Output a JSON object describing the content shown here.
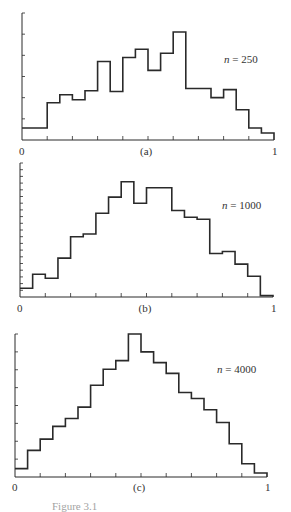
{
  "figure": {
    "caption": "Figure 3.1"
  },
  "chart_data": [
    {
      "type": "bar",
      "subtype": "step-histogram",
      "panel_label": "(a)",
      "annotation": "n = 250",
      "n": 250,
      "xlabel": "",
      "ylabel": "",
      "xlim": [
        0,
        1
      ],
      "x_tick_labels": [
        "0",
        "1"
      ],
      "x_ticks": [
        0,
        0.1,
        0.2,
        0.3,
        0.4,
        0.5,
        0.6,
        0.7,
        0.8,
        0.9,
        1.0
      ],
      "y_tick_count": 6,
      "ylim": [
        0,
        6
      ],
      "grid": false,
      "bin_edges": [
        0,
        0.05,
        0.1,
        0.15,
        0.2,
        0.25,
        0.3,
        0.35,
        0.4,
        0.45,
        0.5,
        0.55,
        0.6,
        0.65,
        0.7,
        0.75,
        0.8,
        0.85,
        0.9,
        0.95,
        1.0
      ],
      "values": [
        0.57,
        0.57,
        1.76,
        2.14,
        1.9,
        2.33,
        3.71,
        2.29,
        3.9,
        4.29,
        3.29,
        4.1,
        5.1,
        2.43,
        2.43,
        2.0,
        2.38,
        1.43,
        0.57,
        0.33
      ]
    },
    {
      "type": "bar",
      "subtype": "step-histogram",
      "panel_label": "(b)",
      "annotation": "n = 1000",
      "n": 1000,
      "xlabel": "",
      "ylabel": "",
      "xlim": [
        0,
        1
      ],
      "x_tick_labels": [
        "0",
        "1"
      ],
      "x_ticks": [
        0,
        0.1,
        0.2,
        0.3,
        0.4,
        0.5,
        0.6,
        0.7,
        0.8,
        0.9,
        1.0
      ],
      "y_tick_count": 20,
      "ylim": [
        0,
        20
      ],
      "grid": false,
      "bin_edges": [
        0,
        0.05,
        0.1,
        0.15,
        0.2,
        0.25,
        0.3,
        0.35,
        0.4,
        0.45,
        0.5,
        0.55,
        0.6,
        0.65,
        0.7,
        0.75,
        0.8,
        0.85,
        0.9,
        0.95,
        1.0
      ],
      "values": [
        1.3,
        3.4,
        2.8,
        5.8,
        9.0,
        9.4,
        12.5,
        14.9,
        17.2,
        14.0,
        16.3,
        16.3,
        12.9,
        11.9,
        11.6,
        6.5,
        6.8,
        4.9,
        3.1,
        0.2
      ]
    },
    {
      "type": "bar",
      "subtype": "step-histogram",
      "panel_label": "(c)",
      "annotation": "n = 4000",
      "n": 4000,
      "xlabel": "",
      "ylabel": "",
      "xlim": [
        0,
        1
      ],
      "x_tick_labels": [
        "0",
        "1"
      ],
      "x_ticks": [
        0,
        0.1,
        0.2,
        0.3,
        0.4,
        0.5,
        0.6,
        0.7,
        0.8,
        0.9,
        1.0
      ],
      "y_tick_count": 8,
      "ylim": [
        0,
        8
      ],
      "grid": false,
      "bin_edges": [
        0,
        0.05,
        0.1,
        0.15,
        0.2,
        0.25,
        0.3,
        0.35,
        0.4,
        0.45,
        0.5,
        0.55,
        0.6,
        0.65,
        0.7,
        0.75,
        0.8,
        0.85,
        0.9,
        0.95,
        1.0
      ],
      "values": [
        0.47,
        1.49,
        2.12,
        2.83,
        3.27,
        3.91,
        5.13,
        6.03,
        6.51,
        8.0,
        7.0,
        6.4,
        5.8,
        4.73,
        4.39,
        3.76,
        3.05,
        1.86,
        0.74,
        0.22
      ]
    }
  ],
  "layout": {
    "panels": [
      {
        "x0": 22,
        "x1": 274,
        "base": 140,
        "top": 13,
        "label_y": 146,
        "n_x": 224,
        "n_y": 54
      },
      {
        "x0": 20,
        "x1": 273,
        "base": 297,
        "top": 163,
        "label_y": 303,
        "n_x": 222,
        "n_y": 200
      },
      {
        "x0": 15,
        "x1": 267,
        "base": 477,
        "top": 334,
        "label_y": 482,
        "n_x": 217,
        "n_y": 364
      }
    ]
  }
}
